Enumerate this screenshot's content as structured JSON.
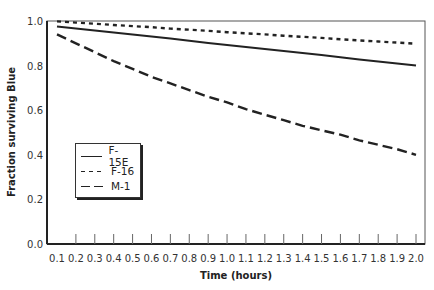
{
  "chart_data": {
    "type": "line",
    "title": "",
    "xlabel": "Time (hours)",
    "ylabel": "Fraction surviving Blue",
    "x": [
      0.1,
      0.2,
      0.3,
      0.4,
      0.5,
      0.6,
      0.7,
      0.8,
      0.9,
      1.0,
      1.1,
      1.2,
      1.3,
      1.4,
      1.5,
      1.6,
      1.7,
      1.8,
      1.9,
      2.0
    ],
    "x_tick_labels": [
      "0.1",
      "0.2",
      "0.3",
      "0.4",
      "0.5",
      "0.6",
      "0.7",
      "0.8",
      "0.9",
      "1.0",
      "1.1",
      "1.2",
      "1.3",
      "1.4",
      "1.5",
      "1.6",
      "1.7",
      "1.8",
      "1.9",
      "2.0"
    ],
    "y_tick_labels": [
      "0.0",
      "0.2",
      "0.4",
      "0.6",
      "0.8",
      "1.0"
    ],
    "ylim": [
      0.0,
      1.0
    ],
    "xlim": [
      0.05,
      2.05
    ],
    "grid": false,
    "legend_position": "inside-left-middle",
    "series": [
      {
        "name": "F-15E",
        "style": "solid",
        "values": [
          0.975,
          0.966,
          0.957,
          0.948,
          0.939,
          0.93,
          0.921,
          0.911,
          0.902,
          0.893,
          0.884,
          0.874,
          0.865,
          0.856,
          0.847,
          0.837,
          0.828,
          0.819,
          0.809,
          0.8
        ]
      },
      {
        "name": "F-16",
        "style": "dotted",
        "values": [
          0.998,
          0.993,
          0.988,
          0.982,
          0.977,
          0.972,
          0.966,
          0.961,
          0.956,
          0.95,
          0.945,
          0.94,
          0.934,
          0.929,
          0.924,
          0.918,
          0.913,
          0.908,
          0.903,
          0.898
        ]
      },
      {
        "name": "M-1",
        "style": "dashed",
        "values": [
          0.94,
          0.9,
          0.86,
          0.82,
          0.785,
          0.75,
          0.72,
          0.69,
          0.66,
          0.635,
          0.605,
          0.58,
          0.555,
          0.53,
          0.51,
          0.49,
          0.465,
          0.445,
          0.425,
          0.4
        ]
      }
    ]
  },
  "legend": {
    "items": [
      {
        "label": "F-15E"
      },
      {
        "label": "F-16"
      },
      {
        "label": "M-1"
      }
    ]
  },
  "colors": {
    "line": "#222222",
    "axis": "#222222",
    "background": "#ffffff"
  }
}
